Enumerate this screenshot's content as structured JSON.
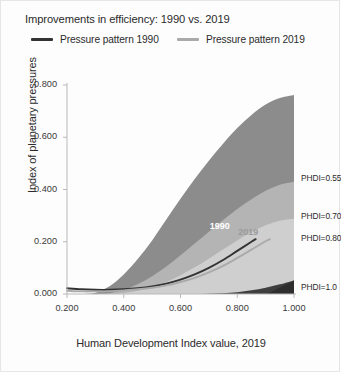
{
  "card": {
    "title": "Improvements in efficiency: 1990 vs. 2019",
    "background": "#fdfdfd",
    "border_color": "#e6e6e6"
  },
  "legend": {
    "position": "top",
    "items": [
      {
        "label": "Pressure pattern 1990",
        "color": "#333333"
      },
      {
        "label": "Pressure pattern 2019",
        "color": "#aaaaaa"
      }
    ]
  },
  "chart_data": {
    "type": "area",
    "title": "Improvements in efficiency: 1990 vs. 2019",
    "xlabel": "Human Development Index value, 2019",
    "ylabel": "Index of planetary pressures",
    "xlim": [
      0.2,
      1.0
    ],
    "ylim": [
      0.0,
      0.8
    ],
    "xticks": [
      0.2,
      0.4,
      0.6,
      0.8,
      1.0
    ],
    "xtick_labels": [
      "0.200",
      "0.400",
      "0.600",
      "0.800",
      "1.000"
    ],
    "yticks": [
      0.0,
      0.2,
      0.4,
      0.6,
      0.8
    ],
    "ytick_labels": [
      "0.000",
      "0.200",
      "0.400",
      "0.600",
      "0.800"
    ],
    "grid": false,
    "legend_position": "above-plot",
    "x": [
      0.2,
      0.25,
      0.3,
      0.35,
      0.4,
      0.45,
      0.5,
      0.55,
      0.6,
      0.65,
      0.7,
      0.75,
      0.8,
      0.85,
      0.9,
      0.95,
      1.0
    ],
    "bands": [
      {
        "name": "PHDI=0.55",
        "label": "PHDI=0.55",
        "color": "#8c8c8c",
        "upper": [
          0.0,
          0.0,
          0.005,
          0.03,
          0.075,
          0.135,
          0.205,
          0.285,
          0.365,
          0.44,
          0.51,
          0.575,
          0.635,
          0.685,
          0.725,
          0.75,
          0.762
        ],
        "label_y": 0.445
      },
      {
        "name": "PHDI=0.70",
        "label": "PHDI=0.70",
        "color": "#b4b4b4",
        "upper": [
          0.0,
          0.0,
          0.0,
          0.003,
          0.016,
          0.038,
          0.068,
          0.105,
          0.148,
          0.193,
          0.238,
          0.283,
          0.325,
          0.363,
          0.395,
          0.418,
          0.43
        ],
        "label_y": 0.3
      },
      {
        "name": "PHDI=0.80",
        "label": "PHDI=0.80",
        "color": "#cfcfcf",
        "upper": [
          0.0,
          0.0,
          0.0,
          0.0,
          0.004,
          0.012,
          0.026,
          0.046,
          0.072,
          0.102,
          0.135,
          0.17,
          0.205,
          0.237,
          0.263,
          0.28,
          0.288
        ],
        "label_y": 0.215
      },
      {
        "name": "PHDI=1.0",
        "label": "PHDI=1.0",
        "color": "#3f3f3f",
        "upper": [
          0.0,
          0.0,
          0.0,
          0.0,
          0.0,
          0.0,
          0.0,
          0.0,
          0.0,
          0.0,
          0.001,
          0.003,
          0.007,
          0.014,
          0.024,
          0.037,
          0.052
        ],
        "label_y": 0.025
      }
    ],
    "series": [
      {
        "name": "Pressure pattern 1990",
        "tag": "1990",
        "color": "#333333",
        "x": [
          0.2,
          0.25,
          0.3,
          0.35,
          0.4,
          0.45,
          0.5,
          0.55,
          0.6,
          0.65,
          0.7,
          0.75,
          0.8,
          0.85,
          0.865
        ],
        "values": [
          0.022,
          0.018,
          0.016,
          0.016,
          0.018,
          0.022,
          0.029,
          0.04,
          0.055,
          0.075,
          0.1,
          0.13,
          0.165,
          0.2,
          0.21
        ],
        "tag_x": 0.735,
        "tag_y": 0.255,
        "tag_color": "#ffffff"
      },
      {
        "name": "Pressure pattern 2019",
        "tag": "2019",
        "color": "#aaaaaa",
        "x": [
          0.2,
          0.25,
          0.3,
          0.35,
          0.4,
          0.45,
          0.5,
          0.55,
          0.6,
          0.65,
          0.7,
          0.75,
          0.8,
          0.85,
          0.9,
          0.915
        ],
        "values": [
          0.012,
          0.01,
          0.01,
          0.011,
          0.014,
          0.018,
          0.024,
          0.033,
          0.046,
          0.062,
          0.083,
          0.108,
          0.138,
          0.17,
          0.202,
          0.21
        ],
        "tag_x": 0.835,
        "tag_y": 0.232,
        "tag_color": "#9a9a9a"
      }
    ],
    "corner_marker": {
      "name": "phdi-1-wedge",
      "color": "#2e2e2e",
      "x_start": 0.905,
      "x_end": 1.0,
      "y_top": 0.052
    }
  }
}
